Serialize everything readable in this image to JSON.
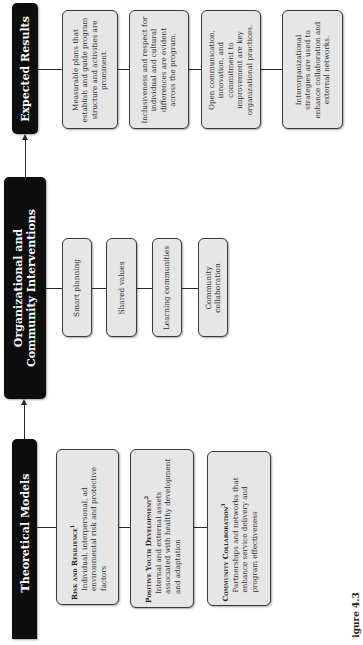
{
  "figure": {
    "orientation": "rotated-90-ccw",
    "caption": "igure 4.3",
    "colors": {
      "header_bg": "#0d0d0d",
      "header_text": "#ffffff",
      "box_bg": "#e6e6e6",
      "box_border": "#3a3a3a",
      "connector": "#2a2a2a"
    }
  },
  "columns": {
    "theoretical_models": {
      "title": "Theoretical Models",
      "items": [
        {
          "title": "Risk and Resilience",
          "superscript": "1",
          "description": "Individual, interpersonal, ad environmental risk and protective factors"
        },
        {
          "title": "Positive Youth Development",
          "superscript": "2",
          "description": "Internal and external assets associated with healthy development and adaptation"
        },
        {
          "title": "Community Collaboration",
          "superscript": "3",
          "description": "Partnerships and networks that enhance service delivery and program effectiveness"
        }
      ]
    },
    "interventions": {
      "title_line1": "Organizational and",
      "title_line2": "Community Interventions",
      "items": [
        {
          "label": "Smart planning"
        },
        {
          "label": "Shared values"
        },
        {
          "label": "Learning communities"
        },
        {
          "label": "Community collaboration"
        }
      ]
    },
    "expected_results": {
      "title": "Expected Results",
      "items": [
        {
          "label": "Measurable plans that establish and guide program structure and activities are prominent."
        },
        {
          "label": "Inclusiveness and respect for individual and cultural differences are evident across the program."
        },
        {
          "label": "Open communication, innovation, and commitment to improvement are key organizational practices."
        },
        {
          "label": "Interorganizational strategies are used to enhance collaboration and external networks."
        }
      ]
    }
  }
}
